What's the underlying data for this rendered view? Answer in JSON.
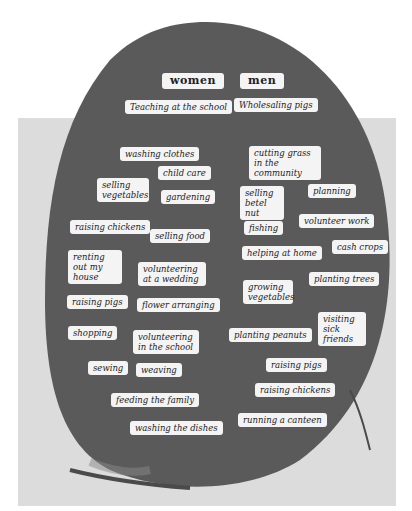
{
  "headers": {
    "women": "women",
    "men": "men"
  },
  "women_tasks": [
    "Teaching at the school",
    "washing clothes",
    "child care",
    "selling vegetables",
    "gardening",
    "raising chickens",
    "selling food",
    "renting out my house",
    "volunteering at a wedding",
    "raising pigs",
    "flower arranging",
    "shopping",
    "volunteering in the school",
    "sewing",
    "weaving",
    "feeding the family",
    "washing the dishes"
  ],
  "men_tasks": [
    "Wholesaling pigs",
    "cutting grass in the community",
    "selling betel nut",
    "planning",
    "fishing",
    "volunteer work",
    "helping at home",
    "cash crops",
    "growing vegetables",
    "planting trees",
    "visiting sick friends",
    "planting peanuts",
    "raising pigs",
    "raising chickens",
    "running a canteen"
  ]
}
